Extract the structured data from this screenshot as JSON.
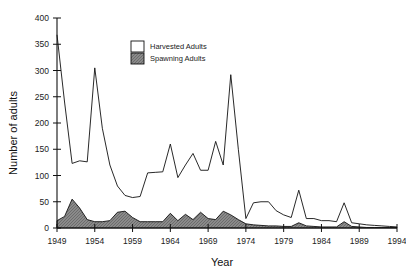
{
  "chart_data": {
    "type": "area",
    "title": "",
    "xlabel": "Year",
    "ylabel": "Number of adults",
    "xlim": [
      1949,
      1994
    ],
    "ylim": [
      0,
      400
    ],
    "ytick_step": 50,
    "xtick_step": 5,
    "yticks": [
      0,
      50,
      100,
      150,
      200,
      250,
      300,
      350,
      400
    ],
    "xticks": [
      1949,
      1954,
      1959,
      1964,
      1969,
      1974,
      1979,
      1984,
      1989,
      1994
    ],
    "grid": false,
    "legend_position": "top-center-right",
    "x": [
      1949,
      1950,
      1951,
      1952,
      1953,
      1954,
      1955,
      1956,
      1957,
      1958,
      1959,
      1960,
      1961,
      1962,
      1963,
      1964,
      1965,
      1966,
      1967,
      1968,
      1969,
      1970,
      1971,
      1972,
      1973,
      1974,
      1975,
      1976,
      1977,
      1978,
      1979,
      1980,
      1981,
      1982,
      1983,
      1984,
      1985,
      1986,
      1987,
      1988,
      1989,
      1990,
      1991,
      1992,
      1993,
      1994
    ],
    "series": [
      {
        "name": "Harvested Adults",
        "fill": "#ffffff",
        "stroke": "#111111",
        "values": [
          368,
          240,
          123,
          128,
          126,
          305,
          190,
          120,
          80,
          62,
          58,
          60,
          105,
          106,
          107,
          160,
          96,
          120,
          142,
          110,
          110,
          165,
          120,
          292,
          150,
          18,
          48,
          50,
          50,
          33,
          25,
          20,
          72,
          18,
          18,
          14,
          14,
          12,
          48,
          10,
          8,
          6,
          5,
          4,
          3,
          2
        ]
      },
      {
        "name": "Spawning Adults",
        "fill": "#808080",
        "stroke": "#111111",
        "values": [
          14,
          22,
          55,
          38,
          16,
          12,
          12,
          14,
          30,
          32,
          20,
          12,
          12,
          12,
          12,
          28,
          14,
          26,
          16,
          30,
          18,
          16,
          32,
          25,
          16,
          8,
          6,
          5,
          4,
          4,
          3,
          3,
          10,
          4,
          3,
          2,
          2,
          2,
          12,
          3,
          2,
          1,
          1,
          1,
          1,
          1
        ]
      }
    ]
  },
  "legend": {
    "items": [
      {
        "label": "Harvested Adults",
        "swatch": "#ffffff"
      },
      {
        "label": "Spawning Adults",
        "swatch": "#808080"
      }
    ]
  }
}
